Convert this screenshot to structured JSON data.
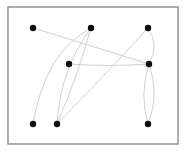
{
  "figure": {
    "background_color": "#ffffff",
    "frame": {
      "name": "plot-border",
      "x": 8,
      "y": 7,
      "width": 170,
      "height": 137,
      "stroke_color": "#8a8a8a",
      "stroke_width": 1.4
    }
  },
  "chart_data": {
    "type": "diagram",
    "subtype": "node-link-graph",
    "xlabel": "",
    "ylabel": "",
    "grid": false,
    "legend": false,
    "node_count": 8,
    "edge_count": 9,
    "node_color": "#0d0d0d",
    "edge_color": "#c9c9c9",
    "node_radius": 3.2,
    "edge_width": 0.9,
    "coordinate_space": {
      "x_range": [
        0,
        195
      ],
      "y_range": [
        0,
        157
      ],
      "origin": "top-left"
    },
    "nodes": [
      {
        "id": "n1",
        "label": "top-left",
        "x": 33,
        "y": 28
      },
      {
        "id": "n2",
        "label": "top-middle",
        "x": 91,
        "y": 28
      },
      {
        "id": "n3",
        "label": "top-right",
        "x": 148,
        "y": 28
      },
      {
        "id": "n4",
        "label": "center-left",
        "x": 69,
        "y": 64
      },
      {
        "id": "n5",
        "label": "center-right",
        "x": 149,
        "y": 64
      },
      {
        "id": "n6",
        "label": "bottom-left",
        "x": 33,
        "y": 124
      },
      {
        "id": "n7",
        "label": "bottom-mid-left",
        "x": 57,
        "y": 124
      },
      {
        "id": "n8",
        "label": "bottom-right",
        "x": 148,
        "y": 124
      }
    ],
    "edges": [
      {
        "id": "e1",
        "source": "n1",
        "target": "n5",
        "curve": "slight-down",
        "path": "M33,28 Q95,47 149,64"
      },
      {
        "id": "e2",
        "source": "n2",
        "target": "n6",
        "curve": "bow-left",
        "path": "M91,28 Q45,52 33,124"
      },
      {
        "id": "e3",
        "source": "n2",
        "target": "n7",
        "curve": "bow-left-inner",
        "path": "M91,28 Q60,70 57,124"
      },
      {
        "id": "e4",
        "source": "n2",
        "target": "n7",
        "curve": "bow-right-inner",
        "path": "M91,28 Q77,78 57,124"
      },
      {
        "id": "e5",
        "source": "n3",
        "target": "n5",
        "curve": "bow-right",
        "path": "M148,28 Q160,45 149,64"
      },
      {
        "id": "e6",
        "source": "n3",
        "target": "n7",
        "curve": "near-straight",
        "path": "M148,28 Q100,80 57,124"
      },
      {
        "id": "e7",
        "source": "n4",
        "target": "n5",
        "curve": "near-straight",
        "path": "M69,64 Q110,67 149,64"
      },
      {
        "id": "e8",
        "source": "n5",
        "target": "n8",
        "curve": "bow-left",
        "path": "M149,64 Q139,95 148,124"
      },
      {
        "id": "e9",
        "source": "n5",
        "target": "n8",
        "curve": "bow-right",
        "path": "M149,64 Q160,95 148,124"
      }
    ]
  }
}
